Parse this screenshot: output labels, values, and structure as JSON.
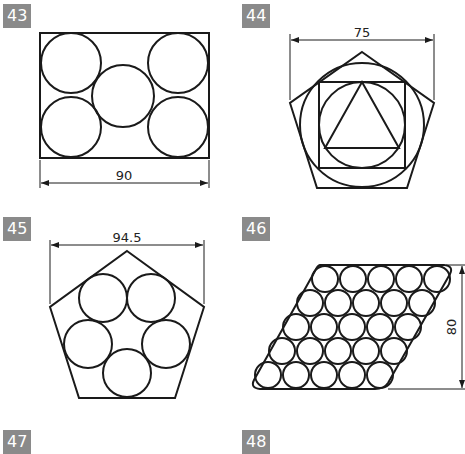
{
  "figures": [
    {
      "number": "43",
      "dimension": "90",
      "description": "Rectangle with five inscribed circles"
    },
    {
      "number": "44",
      "dimension": "75",
      "description": "Pentagon with circle, square, inner circle and triangle"
    },
    {
      "number": "45",
      "dimension": "94.5",
      "description": "Pentagon with five circles"
    },
    {
      "number": "46",
      "dimension": "80",
      "description": "Parallelogram packed with 25 circles"
    },
    {
      "number": "47",
      "dimension": "",
      "description": ""
    },
    {
      "number": "48",
      "dimension": "",
      "description": ""
    }
  ],
  "colors": {
    "badge": "#8a8a8a",
    "line": "#1a1a1a"
  }
}
